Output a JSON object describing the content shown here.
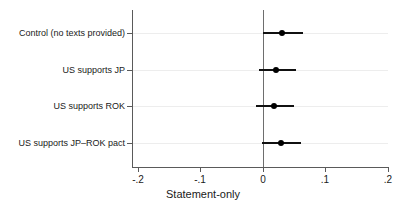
{
  "chart_data": {
    "type": "scatter",
    "subtype": "coefficient-plot",
    "title": "",
    "xlabel": "Statement-only",
    "ylabel": "",
    "xlim": [
      -0.2,
      0.2
    ],
    "xticks": [
      -0.2,
      -0.1,
      0,
      0.1,
      0.2
    ],
    "xticklabels": [
      "-.2",
      "-.1",
      "0",
      ".1",
      ".2"
    ],
    "grid": true,
    "grid_axis": "y",
    "legend": "none",
    "reference_line": 0,
    "categories": [
      "Control (no texts provided)",
      "US supports JP",
      "US supports ROK",
      "US supports JP–ROK pact"
    ],
    "values": [
      0.03,
      0.021,
      0.017,
      0.029
    ],
    "ci_low": [
      0.0,
      -0.007,
      -0.011,
      -0.002
    ],
    "ci_high": [
      0.064,
      0.052,
      0.049,
      0.061
    ],
    "points": [
      {
        "label": "Control (no texts provided)",
        "estimate": 0.03,
        "ci_low": 0.0,
        "ci_high": 0.064
      },
      {
        "label": "US supports JP",
        "estimate": 0.021,
        "ci_low": -0.007,
        "ci_high": 0.052
      },
      {
        "label": "US supports ROK",
        "estimate": 0.017,
        "ci_low": -0.011,
        "ci_high": 0.049
      },
      {
        "label": "US supports JP–ROK pact",
        "estimate": 0.029,
        "ci_low": -0.002,
        "ci_high": 0.061
      }
    ],
    "colors": {
      "marker": "#000000",
      "ci": "#111111",
      "axis": "#5a5a5a",
      "grid": "#ededed",
      "reference": "#6e6e6e",
      "background": "#ffffff"
    }
  }
}
